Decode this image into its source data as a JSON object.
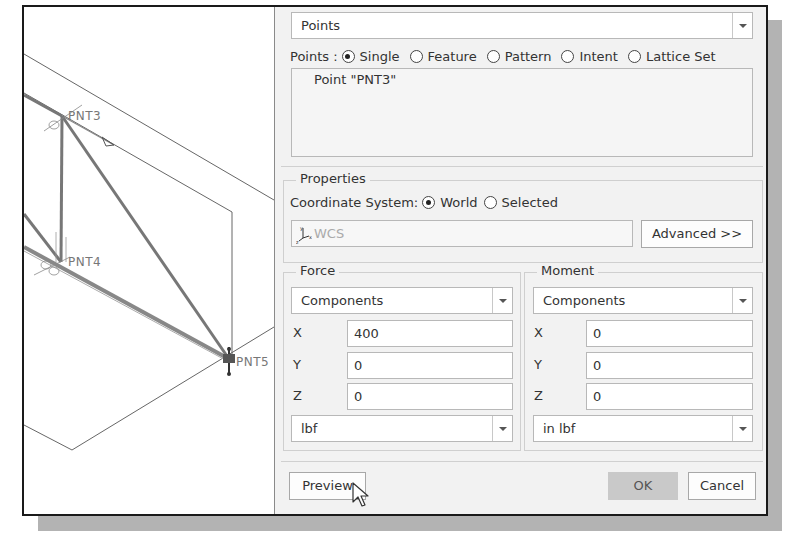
{
  "viewport": {
    "points": [
      {
        "label": "PNT3"
      },
      {
        "label": "PNT4"
      },
      {
        "label": "PNT5"
      }
    ]
  },
  "dialog": {
    "selection_type": {
      "value": "Points",
      "icon": "chevron-down-icon"
    },
    "points_filter": {
      "label": "Points :",
      "options": [
        {
          "label": "Single",
          "selected": true
        },
        {
          "label": "Feature",
          "selected": false
        },
        {
          "label": "Pattern",
          "selected": false
        },
        {
          "label": "Intent",
          "selected": false
        },
        {
          "label": "Lattice Set",
          "selected": false
        }
      ]
    },
    "selected_list": {
      "items": [
        "Point \"PNT3\""
      ]
    },
    "properties": {
      "title": "Properties",
      "coord_label": "Coordinate System:",
      "coord_options": [
        {
          "label": "World",
          "selected": true
        },
        {
          "label": "Selected",
          "selected": false
        }
      ],
      "coord_field": {
        "value": "WCS",
        "icon": "csys-icon"
      },
      "advanced_button": "Advanced >>"
    },
    "force": {
      "title": "Force",
      "mode": "Components",
      "x_label": "X",
      "x_value": "400",
      "y_label": "Y",
      "y_value": "0",
      "z_label": "Z",
      "z_value": "0",
      "unit": "lbf"
    },
    "moment": {
      "title": "Moment",
      "mode": "Components",
      "x_label": "X",
      "x_value": "0",
      "y_label": "Y",
      "y_value": "0",
      "z_label": "Z",
      "z_value": "0",
      "unit": "in lbf"
    },
    "buttons": {
      "preview": "Preview",
      "ok": "OK",
      "cancel": "Cancel"
    }
  }
}
